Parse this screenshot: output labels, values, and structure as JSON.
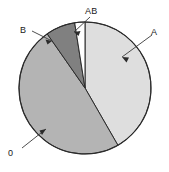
{
  "figure": {
    "width": 169,
    "height": 172,
    "background": "#ffffff"
  },
  "chart_data": {
    "type": "pie",
    "title": "",
    "subtitle": "",
    "xlabel": "",
    "ylabel": "",
    "legend_position": "callout-labels",
    "grid": false,
    "center": {
      "x": 85,
      "y": 88
    },
    "radius": 66,
    "start_angle_deg": 0,
    "direction": "clockwise",
    "categories": [
      "A",
      "O",
      "B",
      "AB"
    ],
    "values": [
      41.7,
      48.6,
      7.2,
      2.5
    ],
    "angles_deg": [
      150,
      175,
      26,
      9
    ],
    "colors": [
      "#dedede",
      "#b4b4b4",
      "#808080",
      "#ffffff"
    ],
    "outline_color": "#2b2b2b",
    "slices": [
      {
        "label": "A",
        "value": 41.7,
        "angle_deg": 150,
        "start_deg": 0,
        "end_deg": 150,
        "color": "#dedede",
        "label_position": "upper-right",
        "callout": "arrow"
      },
      {
        "label": "0",
        "value": 48.6,
        "angle_deg": 175,
        "start_deg": 150,
        "end_deg": 325,
        "color": "#b4b4b4",
        "label_position": "lower-left",
        "callout": "arrow"
      },
      {
        "label": "B",
        "value": 7.2,
        "angle_deg": 26,
        "start_deg": 325,
        "end_deg": 351,
        "color": "#808080",
        "label_position": "upper-left",
        "callout": "arrow"
      },
      {
        "label": "AB",
        "value": 2.5,
        "angle_deg": 9,
        "start_deg": 351,
        "end_deg": 360,
        "color": "#ffffff",
        "label_position": "top",
        "callout": "arrow"
      }
    ]
  },
  "labels": {
    "a": "A",
    "b": "B",
    "ab": "AB",
    "o": "0"
  }
}
